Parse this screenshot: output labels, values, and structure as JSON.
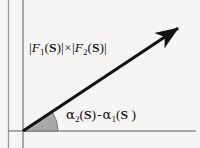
{
  "figure": {
    "name": "vector-phasor-diagram",
    "background_color": "#f6f5f3",
    "axis_color": "#8a8a8a",
    "vector_color": "#111111",
    "wedge_fill_color": "#a9a9a9",
    "wedge_stroke_color": "#6b6b6b",
    "text_color": "#111111"
  },
  "axes": {
    "origin": {
      "x": 23,
      "y": 131
    },
    "horizontal": {
      "x1": 8,
      "y1": 131,
      "x2": 196,
      "y2": 131
    },
    "vertical": {
      "x1": 23,
      "y1": 0,
      "x2": 23,
      "y2": 148
    },
    "left_border": {
      "x1": 8,
      "y1": 0,
      "x2": 8,
      "y2": 148
    }
  },
  "vector": {
    "start": {
      "x": 23,
      "y": 131
    },
    "tip": {
      "x": 181,
      "y": 26
    },
    "angle_degrees": 33,
    "has_arrowhead": true
  },
  "angle_arc": {
    "radius": 35,
    "start_degrees": 0,
    "end_degrees": 33,
    "filled": true
  },
  "labels": {
    "magnitude": {
      "text": "|F1(S)|×|F2(S)|",
      "parts": {
        "bar_open_1": "|",
        "f_1": "F",
        "sub_1": "1",
        "paren_open_1": "(",
        "s_1": "S",
        "paren_close_1": ")",
        "bar_close_1": "|",
        "operator": "×",
        "bar_open_2": "|",
        "f_2": "F",
        "sub_2": "2",
        "paren_open_2": "(",
        "s_2": "S",
        "paren_close_2": ")",
        "bar_close_2": "|"
      }
    },
    "angle": {
      "text": "α2(S) - α1(S )",
      "parts": {
        "alpha_1": "α",
        "sub_1": "2",
        "paren_open_1": "(",
        "s_1": "S",
        "paren_close_1": ")",
        "operator": "-",
        "alpha_2": "α",
        "sub_2": "1",
        "paren_open_2": "(",
        "s_2": "S",
        "paren_close_2": " )"
      }
    }
  }
}
